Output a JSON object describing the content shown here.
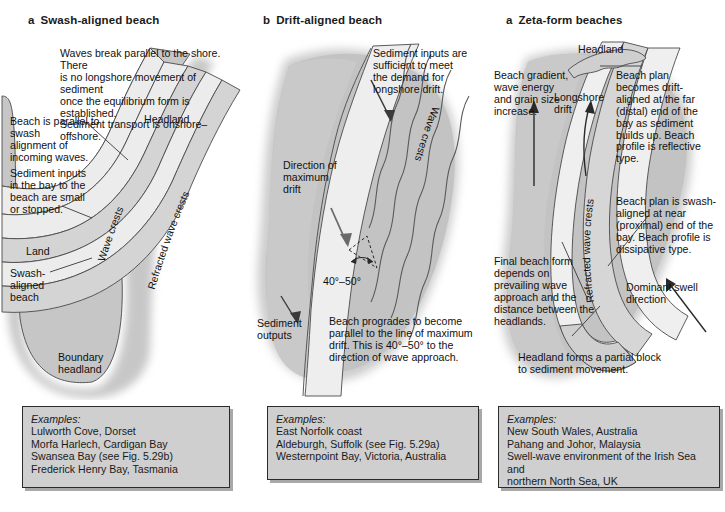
{
  "figure": {
    "background": "#ffffff",
    "land_color": "#c6c6c6",
    "beach_color": "#ececec",
    "wave_band_color": "#d8d8d8",
    "sea_color": "#bdbdbd",
    "line_color": "#3a3a3a",
    "examples_box_fill": "#cfcfcf",
    "examples_box_border": "#2b2b2b"
  },
  "panels": [
    {
      "id": "panel-a",
      "label": "a",
      "title": "Swash-aligned beach",
      "notes": [
        {
          "name": "waves-break-note",
          "text": "Waves break parallel to the shore. There\nis no longshore movement of sediment\nonce the equilibrium form is established.\nSediment transport is onshore–offshore."
        },
        {
          "name": "beach-parallel-note",
          "text": "Beach is parallel to swash\nalignment of\nincoming waves."
        },
        {
          "name": "sediment-inputs-note",
          "text": "Sediment inputs\nin the bay to the\nbeach are small\nor stopped."
        },
        {
          "name": "land-label",
          "text": "Land"
        },
        {
          "name": "swash-aligned-beach-label",
          "text": "Swash-\naligned\nbeach"
        },
        {
          "name": "boundary-headland-label",
          "text": "Boundary\nheadland"
        },
        {
          "name": "headland-label",
          "text": "Headland"
        },
        {
          "name": "wave-crests-label",
          "text": "Wave crests"
        },
        {
          "name": "refracted-wave-crests-label",
          "text": "Refracted wave crests"
        }
      ],
      "examples": {
        "title": "Examples:",
        "items": "Lulworth Cove, Dorset\nMorfa Harlech, Cardigan Bay\nSwansea Bay (see Fig. 5.29b)\nFrederick Henry Bay, Tasmania"
      }
    },
    {
      "id": "panel-b",
      "label": "b",
      "title": "Drift-aligned beach",
      "notes": [
        {
          "name": "sediment-inputs-note",
          "text": "Sediment inputs are\nsufficient to meet\nthe demand for\nlongshore drift."
        },
        {
          "name": "direction-of-maximum-drift-label",
          "text": "Direction of\nmaximum\ndrift"
        },
        {
          "name": "angle-label",
          "text": "40°–50°"
        },
        {
          "name": "sediment-outputs-label",
          "text": "Sediment\noutputs"
        },
        {
          "name": "beach-progrades-note",
          "text": "Beach progrades to become\nparallel to the line of maximum\ndrift. This is 40°–50° to the\ndirection of wave approach."
        },
        {
          "name": "wave-crests-label",
          "text": "Wave crests"
        }
      ],
      "examples": {
        "title": "Examples:",
        "items": "East Norfolk coast\nAldeburgh, Suffolk (see Fig. 5.29a)\nWesternpoint Bay, Victoria, Australia"
      }
    },
    {
      "id": "panel-c",
      "label": "a",
      "title": "Zeta-form beaches",
      "notes": [
        {
          "name": "headland-label",
          "text": "Headland"
        },
        {
          "name": "beach-gradient-note",
          "text": "Beach gradient,\nwave energy\nand grain size\nincrease."
        },
        {
          "name": "longshore-drift-label",
          "text": "Longshore\ndrift"
        },
        {
          "name": "beach-plan-drift-note",
          "text": "Beach plan\nbecomes drift-\naligned at the far\n(distal) end of the\nbay as sediment\nbuilds up. Beach\nprofile is reflective\ntype."
        },
        {
          "name": "beach-plan-swash-note",
          "text": "Beach plan is swash-\naligned at near\n(proximal) end of the\nbay. Beach profile is\ndissipative type."
        },
        {
          "name": "dominant-swell-direction-label",
          "text": "Dominant swell\ndirection"
        },
        {
          "name": "final-beach-form-note",
          "text": "Final beach form\ndepends on\nprevailing wave\napproach and the\ndistance between the\nheadlands."
        },
        {
          "name": "headland-partial-block-note",
          "text": "Headland forms a partial block\nto sediment movement."
        },
        {
          "name": "refracted-wave-crests-label",
          "text": "Refracted wave crests"
        }
      ],
      "examples": {
        "title": "Examples:",
        "items": "New South Wales, Australia\nPahang and Johor, Malaysia\nSwell-wave environment of the Irish Sea and\nnorthern North Sea, UK"
      }
    }
  ]
}
